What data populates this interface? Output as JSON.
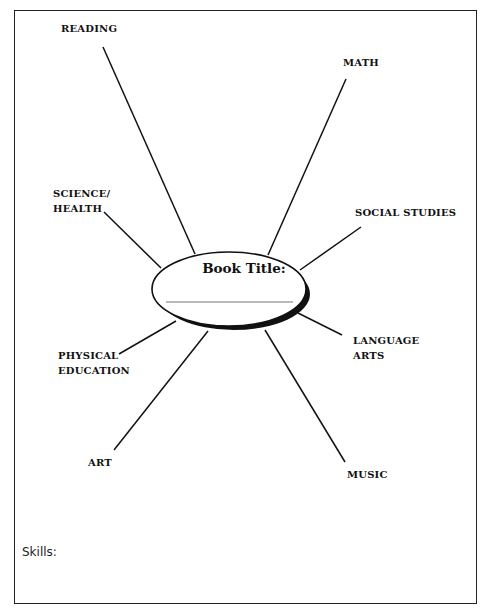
{
  "worksheet": {
    "center": {
      "title": "Book Title:",
      "answer_line": ""
    },
    "subjects": [
      {
        "id": "reading",
        "label": "READING"
      },
      {
        "id": "math",
        "label": "MATH"
      },
      {
        "id": "science-health",
        "label_line1": "SCIENCE/",
        "label_line2": "HEALTH"
      },
      {
        "id": "social-studies",
        "label": "SOCIAL STUDIES"
      },
      {
        "id": "language-arts",
        "label_line1": "LANGUAGE",
        "label_line2": "ARTS"
      },
      {
        "id": "physical-education",
        "label_line1": "PHYSICAL",
        "label_line2": "EDUCATION"
      },
      {
        "id": "art",
        "label": "ART"
      },
      {
        "id": "music",
        "label": "MUSIC"
      }
    ],
    "footer": {
      "skills_label": "Skills:"
    }
  }
}
